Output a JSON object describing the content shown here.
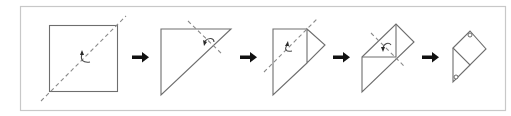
{
  "diagram": {
    "type": "origami-folding-sequence",
    "step_count": 5,
    "colors": {
      "frame": "#c8c8c8",
      "edge": "#6e6e6e",
      "fold_line": "#8a8a8a",
      "arrow": "#111111"
    },
    "steps": [
      {
        "index": 1,
        "shape": "square",
        "fold": "diagonal valley fold",
        "has_fold_arrow": true
      },
      {
        "index": 2,
        "shape": "right triangle",
        "fold": "fold corner at top-right",
        "has_fold_arrow": true
      },
      {
        "index": 3,
        "shape": "triangle with folded flap",
        "fold": "diagonal fold",
        "has_fold_arrow": true
      },
      {
        "index": 4,
        "shape": "folded kite",
        "fold": "diagonal fold",
        "has_fold_arrow": true
      },
      {
        "index": 5,
        "shape": "final diamond with flap",
        "markers": [
          "top circle",
          "bottom circle"
        ]
      }
    ],
    "transitions": [
      "arrow-right",
      "arrow-right",
      "arrow-right",
      "arrow-right"
    ]
  }
}
